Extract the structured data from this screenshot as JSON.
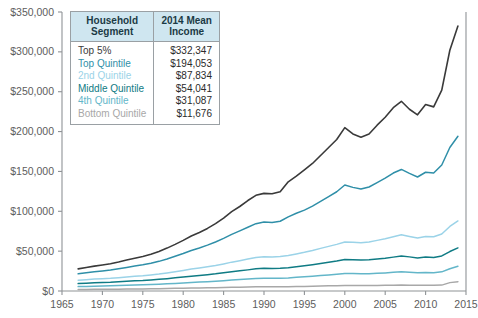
{
  "legend": {
    "headers": [
      "Household\nSegment",
      "2014 Mean\nIncome"
    ],
    "rows": [
      {
        "segment": "Top 5%",
        "income": "$332,347",
        "color": "#3a3a3a"
      },
      {
        "segment": "Top Quintile",
        "income": "$194,053",
        "color": "#2f8fa8"
      },
      {
        "segment": "2nd Quintile",
        "income": "$87,834",
        "color": "#9bd3e8"
      },
      {
        "segment": "Middle Quintile",
        "income": "$54,041",
        "color": "#0f7b84"
      },
      {
        "segment": "4th Quintile",
        "income": "$31,087",
        "color": "#63b6c9"
      },
      {
        "segment": "Bottom Quintile",
        "income": "$11,676",
        "color": "#a8a8a8"
      }
    ]
  },
  "chart_data": {
    "type": "line",
    "title": "",
    "xlabel": "",
    "ylabel": "",
    "xlim": [
      1965,
      2015
    ],
    "ylim": [
      0,
      350000
    ],
    "xticks": [
      1965,
      1970,
      1975,
      1980,
      1985,
      1990,
      1995,
      2000,
      2005,
      2010,
      2015
    ],
    "yticks": [
      0,
      50000,
      100000,
      150000,
      200000,
      250000,
      300000,
      350000
    ],
    "ytick_labels": [
      "$0",
      "$50,000",
      "$100,000",
      "$150,000",
      "$200,000",
      "$250,000",
      "$300,000",
      "$350,000"
    ],
    "xtick_labels": [
      "1965",
      "1970",
      "1975",
      "1980",
      "1985",
      "1990",
      "1995",
      "2000",
      "2005",
      "2010",
      "2015"
    ],
    "grid": false,
    "legend_position": "inside-top-left",
    "x": [
      1967,
      1968,
      1969,
      1970,
      1971,
      1972,
      1973,
      1974,
      1975,
      1976,
      1977,
      1978,
      1979,
      1980,
      1981,
      1982,
      1983,
      1984,
      1985,
      1986,
      1987,
      1988,
      1989,
      1990,
      1991,
      1992,
      1993,
      1994,
      1995,
      1996,
      1997,
      1998,
      1999,
      2000,
      2001,
      2002,
      2003,
      2004,
      2005,
      2006,
      2007,
      2008,
      2009,
      2010,
      2011,
      2012,
      2013,
      2014
    ],
    "series": [
      {
        "name": "Top 5%",
        "color": "#3a3a3a",
        "values": [
          27800,
          29500,
          31200,
          32600,
          34100,
          36300,
          38800,
          41200,
          43300,
          46000,
          49500,
          53800,
          58500,
          63500,
          69000,
          73500,
          78500,
          84500,
          91500,
          99500,
          106000,
          113500,
          120000,
          122500,
          122000,
          124500,
          137000,
          144000,
          152000,
          160000,
          170000,
          180000,
          190000,
          205000,
          197000,
          193000,
          197000,
          208000,
          218000,
          230000,
          238000,
          228000,
          221000,
          234000,
          231000,
          252000,
          302000,
          332347
        ]
      },
      {
        "name": "Top Quintile",
        "color": "#2f8fa8",
        "values": [
          21500,
          22800,
          24100,
          25200,
          26200,
          27800,
          29600,
          31300,
          32800,
          34800,
          37200,
          40200,
          43500,
          47000,
          50800,
          54000,
          57500,
          61500,
          66000,
          71000,
          75500,
          80000,
          84500,
          86500,
          86000,
          87500,
          93000,
          97500,
          101500,
          106500,
          112500,
          118500,
          124500,
          133000,
          130000,
          128000,
          130500,
          136000,
          141500,
          148000,
          152500,
          147500,
          143000,
          149000,
          148000,
          158000,
          180000,
          194053
        ]
      },
      {
        "name": "2nd Quintile",
        "color": "#9bd3e8",
        "values": [
          13500,
          14200,
          14900,
          15400,
          15900,
          16700,
          17700,
          18500,
          19200,
          20200,
          21300,
          22700,
          24200,
          25800,
          27500,
          28800,
          30300,
          32000,
          34000,
          36200,
          38000,
          40000,
          42000,
          43000,
          42800,
          43200,
          44500,
          46500,
          48500,
          50800,
          53500,
          56000,
          58500,
          61500,
          61000,
          60500,
          61500,
          63500,
          65500,
          68000,
          70500,
          68500,
          66500,
          68500,
          68000,
          71500,
          81000,
          87834
        ]
      },
      {
        "name": "Middle Quintile",
        "color": "#0f7b84",
        "values": [
          9300,
          9800,
          10300,
          10700,
          11000,
          11600,
          12300,
          12800,
          13200,
          13900,
          14600,
          15500,
          16500,
          17500,
          18600,
          19500,
          20500,
          21500,
          22800,
          24200,
          25300,
          26500,
          27800,
          28500,
          28300,
          28500,
          29200,
          30500,
          31700,
          33000,
          34500,
          36000,
          37500,
          39500,
          39200,
          38800,
          39200,
          40200,
          41200,
          42500,
          44000,
          42800,
          41500,
          42500,
          42000,
          44000,
          49500,
          54041
        ]
      },
      {
        "name": "4th Quintile",
        "color": "#63b6c9",
        "values": [
          5500,
          5800,
          6100,
          6300,
          6500,
          6800,
          7200,
          7500,
          7700,
          8100,
          8500,
          9000,
          9500,
          10100,
          10700,
          11200,
          11700,
          12300,
          13000,
          13800,
          14400,
          15000,
          15700,
          16100,
          16000,
          16100,
          16400,
          17100,
          17800,
          18500,
          19300,
          20100,
          21000,
          22000,
          21800,
          21500,
          21700,
          22200,
          22700,
          23400,
          24200,
          23500,
          22800,
          23300,
          23000,
          24000,
          28000,
          31087
        ]
      },
      {
        "name": "Bottom Quintile",
        "color": "#a8a8a8",
        "values": [
          1900,
          2000,
          2100,
          2200,
          2250,
          2350,
          2500,
          2600,
          2650,
          2800,
          2900,
          3100,
          3300,
          3500,
          3650,
          3800,
          3950,
          4150,
          4350,
          4600,
          4800,
          5000,
          5200,
          5300,
          5250,
          5300,
          5350,
          5550,
          5750,
          5950,
          6200,
          6450,
          6700,
          7000,
          6900,
          6800,
          6850,
          6950,
          7100,
          7300,
          7500,
          7300,
          7100,
          7200,
          7150,
          7400,
          10500,
          11676
        ]
      }
    ]
  }
}
